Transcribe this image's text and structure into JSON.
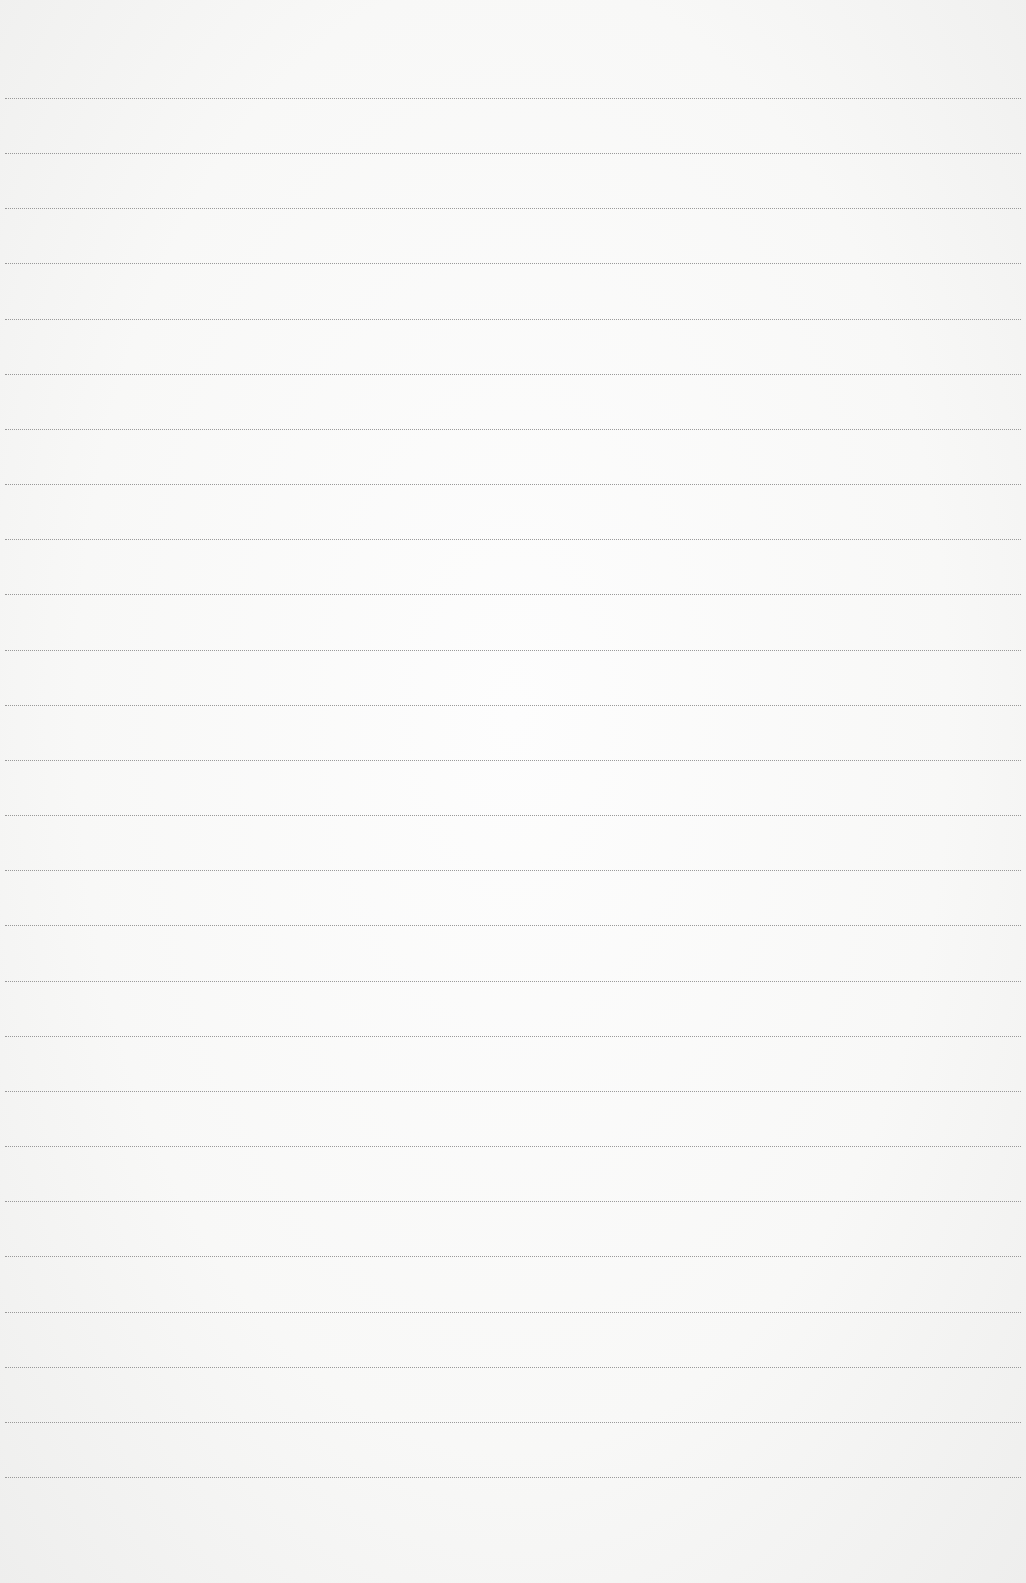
{
  "document": {
    "type": "lined paper",
    "background_color": "#f7f7f6",
    "line_color": "#8a8a8a",
    "line_count": 26,
    "first_line_y": 98,
    "line_spacing": 55.16
  }
}
